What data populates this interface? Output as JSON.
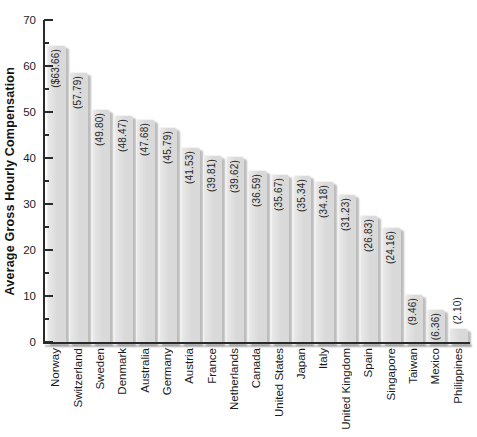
{
  "chart_data": {
    "type": "bar",
    "title": "",
    "xlabel": "",
    "ylabel": "Average Gross Hourly Compensation",
    "ylim": [
      0,
      70
    ],
    "ytick_step": 10,
    "ytick_minor_step": 5,
    "yticks": [
      0,
      10,
      20,
      30,
      40,
      50,
      60,
      70
    ],
    "grid": false,
    "legend_position": "none",
    "categories": [
      "Norway",
      "Switzerland",
      "Sweden",
      "Denmark",
      "Australia",
      "Germany",
      "Austria",
      "France",
      "Netherlands",
      "Canada",
      "United States",
      "Japan",
      "Italy",
      "United Kingdom",
      "Spain",
      "Singapore",
      "Taiwan",
      "Mexico",
      "Philippines"
    ],
    "values": [
      63.66,
      57.79,
      49.8,
      48.47,
      47.68,
      45.79,
      41.53,
      39.81,
      39.62,
      36.59,
      35.67,
      35.34,
      34.18,
      31.23,
      26.83,
      24.16,
      9.46,
      6.36,
      2.1
    ],
    "bar_labels": [
      "($63.66)",
      "(57.79)",
      "(49.80)",
      "(48.47)",
      "(47.68)",
      "(45.79)",
      "(41.53)",
      "(39.81)",
      "(39.62)",
      "(36.59)",
      "(35.67)",
      "(35.34)",
      "(34.18)",
      "(31.23)",
      "(26.83)",
      "(24.16)",
      "(9.46)",
      "(6.36)",
      "(2.10)"
    ]
  },
  "colors": {
    "background": "#ffffff",
    "bar_fill": "#d9d9d9",
    "bar_fill_light": "#e9e9e9",
    "bar_shadow": "#bcbcbc",
    "axis": "#2a2a2a",
    "text": "#1d1d1d"
  }
}
